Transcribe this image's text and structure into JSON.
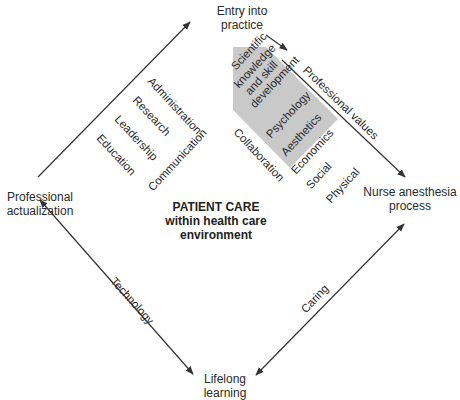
{
  "nodes": {
    "top": "Entry into practice",
    "top_line1": "Entry into",
    "top_line2": "practice",
    "left_line1": "Professional",
    "left_line2": "actualization",
    "right_line1": "Nurse anesthesia",
    "right_line2": "process",
    "bottom_line1": "Lifelong",
    "bottom_line2": "learning"
  },
  "center": {
    "line1": "PATIENT CARE",
    "line2": "within health care",
    "line3": "environment"
  },
  "edges": {
    "top_right": "Professional values",
    "bottom_left": "Technology",
    "bottom_right": "Caring"
  },
  "left_inner_items": [
    "Administration",
    "Research",
    "Leadership",
    "Education",
    "Communication"
  ],
  "right_inner_items": {
    "shaded": [
      "Scientific",
      "knowledge",
      "and skill",
      "development",
      "Psychology",
      "Aesthetics",
      "Economics"
    ],
    "unshaded": [
      "Collaboration",
      "Social",
      "Physical"
    ]
  },
  "colors": {
    "line": "#333333",
    "shade": "#c8c8c8",
    "background": "#ffffff"
  }
}
